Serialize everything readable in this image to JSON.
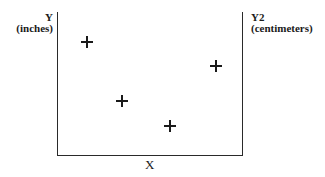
{
  "chart_data": {
    "type": "scatter",
    "title": "",
    "xlabel": "X",
    "ylabel": "Y",
    "ylabel_unit": "(inches)",
    "y2label": "Y2",
    "y2label_unit": "(centimeters)",
    "marker": "plus",
    "grid": false,
    "ticks": false,
    "xlim": [
      0,
      10
    ],
    "ylim": [
      0,
      10
    ],
    "series": [
      {
        "name": "points",
        "x": [
          1.6,
          3.5,
          6.1,
          8.6
        ],
        "y": [
          7.9,
          3.8,
          2.0,
          6.2
        ]
      }
    ]
  }
}
